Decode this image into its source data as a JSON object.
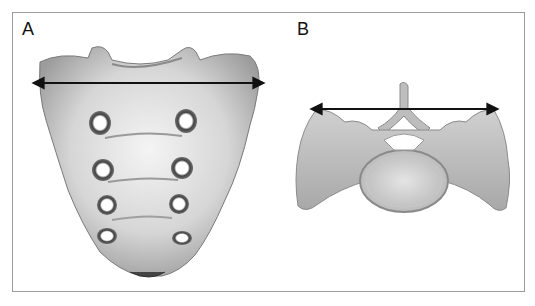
{
  "figure": {
    "panels": [
      {
        "label": "A",
        "subject": "sacrum (anterior view)",
        "measurement": "transverse width arrow across sacral base",
        "arrow": {
          "x1": 38,
          "x2": 259,
          "y": 83
        }
      },
      {
        "label": "B",
        "subject": "sacrum (superior view of S1)",
        "measurement": "transverse width arrow across alae",
        "arrow": {
          "x1": 316,
          "x2": 493,
          "y": 109
        }
      }
    ],
    "colors": {
      "frame": "#9a9a9a",
      "bone_light": "#ececec",
      "bone_mid": "#b5b5b5",
      "bone_dark": "#5a5a5a",
      "arrow": "#111111"
    }
  }
}
